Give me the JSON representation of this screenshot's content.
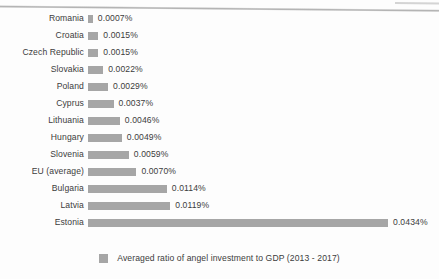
{
  "chart_data": {
    "type": "bar",
    "orientation": "horizontal",
    "title": "",
    "xlabel": "",
    "ylabel": "",
    "grid": false,
    "legend_position": "bottom-center",
    "value_suffix": "%",
    "xlim": [
      0,
      0.0434
    ],
    "series": [
      {
        "name": "Averaged ratio of angel investment to GDP (2013 - 2017)",
        "color": "#a6a6a6",
        "values": [
          0.0007,
          0.0015,
          0.0015,
          0.0022,
          0.0029,
          0.0037,
          0.0046,
          0.0049,
          0.0059,
          0.007,
          0.0114,
          0.0119,
          0.0434
        ]
      }
    ],
    "categories": [
      "Romania",
      "Croatia",
      "Czech Republic",
      "Slovakia",
      "Poland",
      "Cyprus",
      "Lithuania",
      "Hungary",
      "Slovenia",
      "EU (average)",
      "Bulgaria",
      "Latvia",
      "Estonia"
    ],
    "data_labels": [
      "0.0007%",
      "0.0015%",
      "0.0015%",
      "0.0022%",
      "0.0029%",
      "0.0037%",
      "0.0046%",
      "0.0049%",
      "0.0059%",
      "0.0070%",
      "0.0114%",
      "0.0119%",
      "0.0434%"
    ],
    "bars": [
      {
        "category": "Romania",
        "value": 0.0007,
        "label": "0.0007%"
      },
      {
        "category": "Croatia",
        "value": 0.0015,
        "label": "0.0015%"
      },
      {
        "category": "Czech Republic",
        "value": 0.0015,
        "label": "0.0015%"
      },
      {
        "category": "Slovakia",
        "value": 0.0022,
        "label": "0.0022%"
      },
      {
        "category": "Poland",
        "value": 0.0029,
        "label": "0.0029%"
      },
      {
        "category": "Cyprus",
        "value": 0.0037,
        "label": "0.0037%"
      },
      {
        "category": "Lithuania",
        "value": 0.0046,
        "label": "0.0046%"
      },
      {
        "category": "Hungary",
        "value": 0.0049,
        "label": "0.0049%"
      },
      {
        "category": "Slovenia",
        "value": 0.0059,
        "label": "0.0059%"
      },
      {
        "category": "EU (average)",
        "value": 0.007,
        "label": "0.0070%"
      },
      {
        "category": "Bulgaria",
        "value": 0.0114,
        "label": "0.0114%"
      },
      {
        "category": "Latvia",
        "value": 0.0119,
        "label": "0.0119%"
      },
      {
        "category": "Estonia",
        "value": 0.0434,
        "label": "0.0434%"
      }
    ]
  },
  "legend": {
    "entries": [
      {
        "label": "Averaged ratio of angel investment to GDP (2013 - 2017)",
        "color": "#a6a6a6"
      }
    ]
  },
  "colors": {
    "bar": "#a6a6a6",
    "text": "#3c3c3c",
    "background": "#fdfdfd"
  }
}
